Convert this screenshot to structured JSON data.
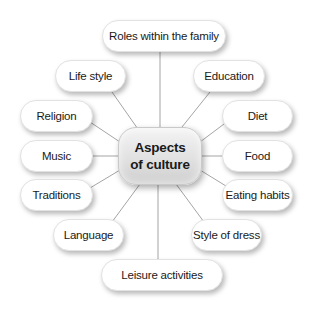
{
  "diagram": {
    "type": "mind-map",
    "center": {
      "line1": "Aspects",
      "line2": "of culture"
    },
    "nodes": [
      {
        "id": "roles",
        "label": "Roles within the family"
      },
      {
        "id": "lifestyle",
        "label": "Life style"
      },
      {
        "id": "education",
        "label": "Education"
      },
      {
        "id": "religion",
        "label": "Religion"
      },
      {
        "id": "diet",
        "label": "Diet"
      },
      {
        "id": "music",
        "label": "Music"
      },
      {
        "id": "food",
        "label": "Food"
      },
      {
        "id": "traditions",
        "label": "Traditions"
      },
      {
        "id": "eating",
        "label": "Eating habits"
      },
      {
        "id": "language",
        "label": "Language"
      },
      {
        "id": "dress",
        "label": "Style of dress"
      },
      {
        "id": "leisure",
        "label": "Leisure activities"
      }
    ],
    "colors": {
      "node_fill": "#ffffff",
      "center_fill": "#dcdcdc",
      "connector": "#9a9a9a",
      "text": "#1a1a1a"
    }
  }
}
